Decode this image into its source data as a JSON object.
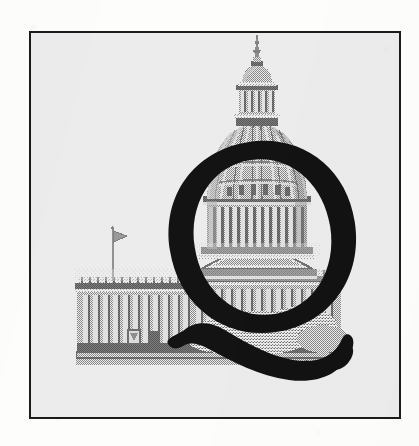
{
  "document": {
    "type": "scanned-print-graphic",
    "description": "Framed halftone photograph of the United States Capitol building overlaid with a large black serif drop-cap letter Q with a swash tail",
    "page_background_color": "#fdfdfc"
  },
  "frame": {
    "name": "artwork-frame",
    "border_color": "#1c1c1c",
    "border_width_px": 2.5,
    "fill_color": "#ffffff",
    "x": 29,
    "y": 31,
    "width": 372,
    "height": 388
  },
  "artwork": {
    "title": "Capitol Q",
    "photo": {
      "subject": "United States Capitol Building",
      "view": "West front, dome and north wing",
      "treatment": "halftone dot screen, grayscale",
      "ink_color": "#8f8f8f",
      "shadow_color": "#6e6e6e",
      "highlight_color": "#d9d9d9",
      "elements": [
        "statue-of-freedom",
        "lantern-cupola",
        "dome-ribs",
        "colonnaded-drum",
        "dome-base-peristyle",
        "pediment",
        "west-facade-columns",
        "terrace-steps",
        "flagpole",
        "tree-foliage"
      ]
    },
    "dropcap": {
      "letter": "Q",
      "style": "transitional serif with swash tail",
      "ink_color": "#131313",
      "cap_height_px": 200
    }
  },
  "colors": {
    "ink_black": "#1c1c1c",
    "letter_black": "#131313",
    "halftone_gray": "#8f8f8f",
    "paper_white": "#ffffff",
    "scan_white": "#fdfdfc"
  }
}
